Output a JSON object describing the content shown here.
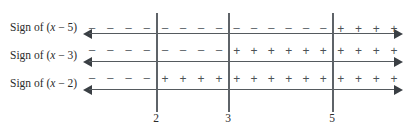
{
  "figure": {
    "width": 414,
    "height": 139,
    "background": "#ffffff",
    "line_color": "#555a5e",
    "arrow_color": "#3a3f44",
    "vline_color": "#5e6368",
    "text_color": "#2b2b2b",
    "sign_color": "#51565b"
  },
  "axis_geometry": {
    "left_px": 83,
    "right_px": 403,
    "vline_top_px": 13,
    "vline_bottom_px": 112
  },
  "critical_points": [
    {
      "value": "2",
      "x_px": 156
    },
    {
      "value": "3",
      "x_px": 228
    },
    {
      "value": "5",
      "x_px": 332
    }
  ],
  "rows": [
    {
      "id": "row-x-minus-5",
      "label_prefix": "Sign of (",
      "label_var": "x",
      "label_suffix": " − 5)",
      "label_full": "Sign of (x − 5)",
      "expression": "x-5",
      "label_y_px": 22,
      "signs_y_px": 23,
      "axis_y_px": 33,
      "intervals": [
        {
          "name": "(-inf, 2)",
          "sign": "−",
          "count": 4
        },
        {
          "name": "(2, 3)",
          "sign": "−",
          "count": 4
        },
        {
          "name": "(3, 5)",
          "sign": "−",
          "count": 6
        },
        {
          "name": "(5, inf)",
          "sign": "+",
          "count": 4
        }
      ]
    },
    {
      "id": "row-x-minus-3",
      "label_prefix": "Sign of (",
      "label_var": "x",
      "label_suffix": " − 3)",
      "label_full": "Sign of (x − 3)",
      "expression": "x-3",
      "label_y_px": 50,
      "signs_y_px": 45,
      "axis_y_px": 61,
      "intervals": [
        {
          "name": "(-inf, 2)",
          "sign": "−",
          "count": 4
        },
        {
          "name": "(2, 3)",
          "sign": "−",
          "count": 4
        },
        {
          "name": "(3, 5)",
          "sign": "+",
          "count": 6
        },
        {
          "name": "(5, inf)",
          "sign": "+",
          "count": 4
        }
      ]
    },
    {
      "id": "row-x-minus-2",
      "label_prefix": "Sign of (",
      "label_var": "x",
      "label_suffix": " − 2)",
      "label_full": "Sign of (x − 2)",
      "expression": "x-2",
      "label_y_px": 78,
      "signs_y_px": 73,
      "axis_y_px": 89,
      "intervals": [
        {
          "name": "(-inf, 2)",
          "sign": "−",
          "count": 4
        },
        {
          "name": "(2, 3)",
          "sign": "+",
          "count": 4
        },
        {
          "name": "(3, 5)",
          "sign": "+",
          "count": 6
        },
        {
          "name": "(5, inf)",
          "sign": "+",
          "count": 4
        }
      ]
    }
  ]
}
